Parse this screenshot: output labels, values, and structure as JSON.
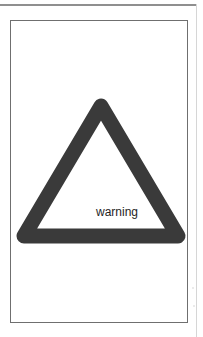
{
  "sign": {
    "label": "warning",
    "icon": "warning-triangle-icon",
    "stroke_color": "#3a3a3a",
    "fill_color": "#ffffff"
  },
  "frame": {
    "border_color": "#6f6f6f"
  }
}
